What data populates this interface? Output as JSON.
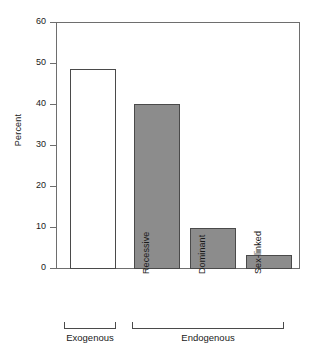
{
  "chart_data": {
    "type": "bar",
    "title": "",
    "subtitle": "",
    "xlabel": "",
    "ylabel": "Percent",
    "ylim": [
      0,
      60
    ],
    "yticks": [
      0,
      10,
      20,
      30,
      40,
      50,
      60
    ],
    "ytick_labels": [
      "0",
      "10",
      "20",
      "30",
      "40",
      "50",
      "60"
    ],
    "grid": false,
    "legend": null,
    "categories": [
      "",
      "Recessive",
      "Dominant",
      "Sex-linked"
    ],
    "values": [
      48.5,
      40,
      10,
      3.5
    ],
    "bar_styles": [
      "hollow",
      "filled",
      "filled",
      "filled"
    ],
    "groups": [
      {
        "label": "Exogenous",
        "members": [
          0
        ]
      },
      {
        "label": "Endogenous",
        "members": [
          1,
          2,
          3
        ]
      }
    ],
    "colors": {
      "bar_fill": "#8c8c8c",
      "bar_edge": "#4a4a4a",
      "hollow_fill": "#ffffff",
      "axis": "#6e6e6e",
      "text": "#1a1a1a",
      "background": "#ffffff"
    }
  }
}
